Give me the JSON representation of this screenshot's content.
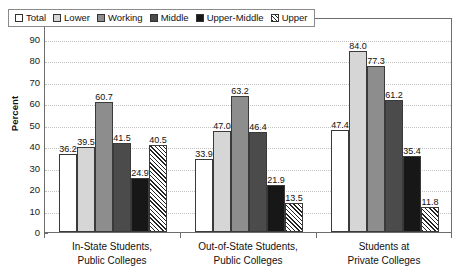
{
  "chart_data": {
    "type": "bar",
    "title": "",
    "subtitle": "",
    "xlabel": "",
    "ylabel": "Percent",
    "ylim": [
      0,
      100
    ],
    "ytick_step": 10,
    "ytick_labels": [
      "0",
      "10",
      "20",
      "30",
      "40",
      "50",
      "60",
      "70",
      "80",
      "90",
      "100"
    ],
    "grid": true,
    "grid_style": "dotted-horizontal",
    "legend_position": "top-left-inside",
    "categories": [
      {
        "line1": "In-State Students,",
        "line2": "Public Colleges"
      },
      {
        "line1": "Out-of-State Students,",
        "line2": "Public Colleges"
      },
      {
        "line1": "Students at",
        "line2": "Private Colleges"
      }
    ],
    "series": [
      {
        "name": "Total",
        "fill": "white",
        "color": "#ffffff",
        "values": [
          36.2,
          33.9,
          47.4
        ],
        "labels": [
          "36.2",
          "33.9",
          "47.4"
        ]
      },
      {
        "name": "Lower",
        "fill": "light-gray",
        "color": "#d6d6d6",
        "values": [
          39.5,
          47.0,
          84.0
        ],
        "labels": [
          "39.5",
          "47.0",
          "84.0"
        ]
      },
      {
        "name": "Working",
        "fill": "medium-gray",
        "color": "#8d8d8d",
        "values": [
          60.7,
          63.2,
          77.3
        ],
        "labels": [
          "60.7",
          "63.2",
          "77.3"
        ]
      },
      {
        "name": "Middle",
        "fill": "dark-gray",
        "color": "#4b4b4b",
        "values": [
          41.5,
          46.4,
          61.2
        ],
        "labels": [
          "41.5",
          "46.4",
          "61.2"
        ]
      },
      {
        "name": "Upper-Middle",
        "fill": "black",
        "color": "#171717",
        "values": [
          24.9,
          21.9,
          35.4
        ],
        "labels": [
          "24.9",
          "21.9",
          "35.4"
        ]
      },
      {
        "name": "Upper",
        "fill": "diagonal-hatch",
        "color": "#ffffff",
        "values": [
          40.5,
          13.5,
          11.8
        ],
        "labels": [
          "40.5",
          "13.5",
          "11.8"
        ]
      }
    ]
  }
}
